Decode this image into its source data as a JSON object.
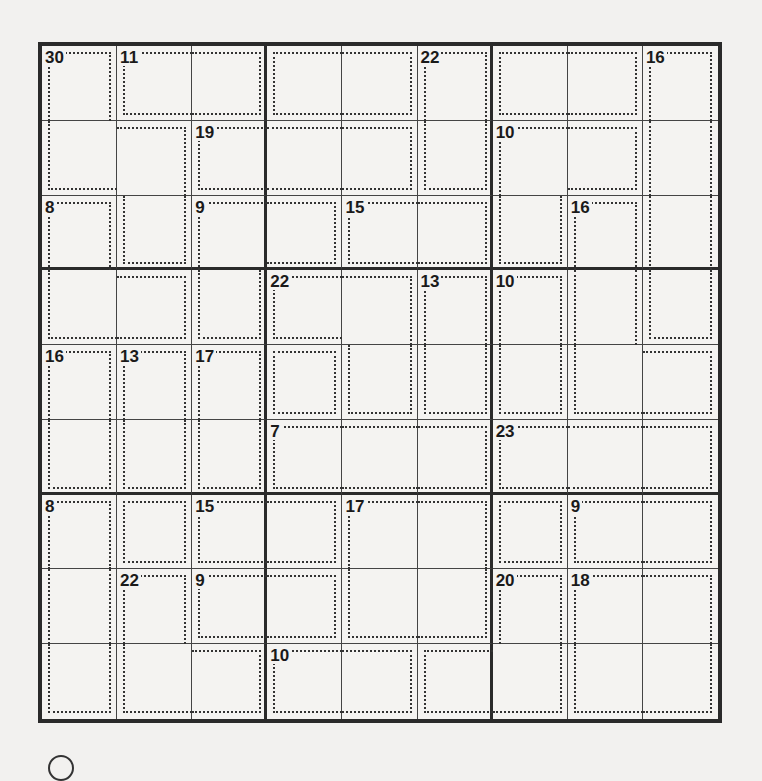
{
  "puzzle": {
    "type": "killer-sudoku",
    "size": 9,
    "cages": [
      {
        "sum": "30",
        "cells": [
          [
            0,
            0
          ],
          [
            1,
            0
          ],
          [
            1,
            1
          ],
          [
            2,
            1
          ]
        ]
      },
      {
        "sum": "11",
        "cells": [
          [
            0,
            1
          ],
          [
            0,
            2
          ]
        ]
      },
      {
        "sum": "",
        "cells": [
          [
            0,
            3
          ],
          [
            0,
            4
          ]
        ]
      },
      {
        "sum": "22",
        "cells": [
          [
            0,
            5
          ],
          [
            1,
            5
          ]
        ]
      },
      {
        "sum": "",
        "cells": [
          [
            0,
            6
          ],
          [
            0,
            7
          ]
        ]
      },
      {
        "sum": "16",
        "cells": [
          [
            0,
            8
          ],
          [
            1,
            8
          ],
          [
            2,
            8
          ],
          [
            3,
            8
          ]
        ]
      },
      {
        "sum": "19",
        "cells": [
          [
            1,
            2
          ],
          [
            1,
            3
          ],
          [
            1,
            4
          ]
        ]
      },
      {
        "sum": "10",
        "cells": [
          [
            1,
            6
          ],
          [
            1,
            7
          ],
          [
            2,
            6
          ]
        ]
      },
      {
        "sum": "8",
        "cells": [
          [
            2,
            0
          ],
          [
            3,
            0
          ],
          [
            3,
            1
          ]
        ]
      },
      {
        "sum": "9",
        "cells": [
          [
            2,
            2
          ],
          [
            2,
            3
          ],
          [
            3,
            2
          ]
        ]
      },
      {
        "sum": "15",
        "cells": [
          [
            2,
            4
          ],
          [
            2,
            5
          ]
        ]
      },
      {
        "sum": "16",
        "cells": [
          [
            2,
            7
          ],
          [
            3,
            7
          ],
          [
            4,
            7
          ],
          [
            4,
            8
          ]
        ]
      },
      {
        "sum": "22",
        "cells": [
          [
            3,
            3
          ],
          [
            3,
            4
          ],
          [
            4,
            4
          ]
        ]
      },
      {
        "sum": "13",
        "cells": [
          [
            3,
            5
          ],
          [
            4,
            5
          ]
        ]
      },
      {
        "sum": "10",
        "cells": [
          [
            3,
            6
          ],
          [
            4,
            6
          ]
        ]
      },
      {
        "sum": "",
        "cells": [
          [
            4,
            3
          ]
        ]
      },
      {
        "sum": "16",
        "cells": [
          [
            4,
            0
          ],
          [
            5,
            0
          ]
        ]
      },
      {
        "sum": "13",
        "cells": [
          [
            4,
            1
          ],
          [
            5,
            1
          ]
        ]
      },
      {
        "sum": "17",
        "cells": [
          [
            4,
            2
          ],
          [
            5,
            2
          ]
        ]
      },
      {
        "sum": "7",
        "cells": [
          [
            5,
            3
          ],
          [
            5,
            4
          ],
          [
            5,
            5
          ]
        ]
      },
      {
        "sum": "23",
        "cells": [
          [
            5,
            6
          ],
          [
            5,
            7
          ],
          [
            5,
            8
          ]
        ]
      },
      {
        "sum": "8",
        "cells": [
          [
            6,
            0
          ],
          [
            7,
            0
          ],
          [
            8,
            0
          ]
        ]
      },
      {
        "sum": "",
        "cells": [
          [
            6,
            1
          ]
        ]
      },
      {
        "sum": "15",
        "cells": [
          [
            6,
            2
          ],
          [
            6,
            3
          ]
        ]
      },
      {
        "sum": "17",
        "cells": [
          [
            6,
            4
          ],
          [
            6,
            5
          ],
          [
            7,
            4
          ],
          [
            7,
            5
          ]
        ]
      },
      {
        "sum": "",
        "cells": [
          [
            6,
            6
          ]
        ]
      },
      {
        "sum": "9",
        "cells": [
          [
            6,
            7
          ],
          [
            6,
            8
          ]
        ]
      },
      {
        "sum": "22",
        "cells": [
          [
            7,
            1
          ],
          [
            8,
            1
          ],
          [
            8,
            2
          ]
        ]
      },
      {
        "sum": "9",
        "cells": [
          [
            7,
            2
          ],
          [
            7,
            3
          ]
        ]
      },
      {
        "sum": "20",
        "cells": [
          [
            7,
            6
          ],
          [
            8,
            5
          ],
          [
            8,
            6
          ]
        ]
      },
      {
        "sum": "18",
        "cells": [
          [
            7,
            7
          ],
          [
            7,
            8
          ],
          [
            8,
            7
          ],
          [
            8,
            8
          ]
        ]
      },
      {
        "sum": "10",
        "cells": [
          [
            8,
            3
          ],
          [
            8,
            4
          ]
        ]
      }
    ]
  },
  "footer": {
    "icon": "circle-icon"
  }
}
